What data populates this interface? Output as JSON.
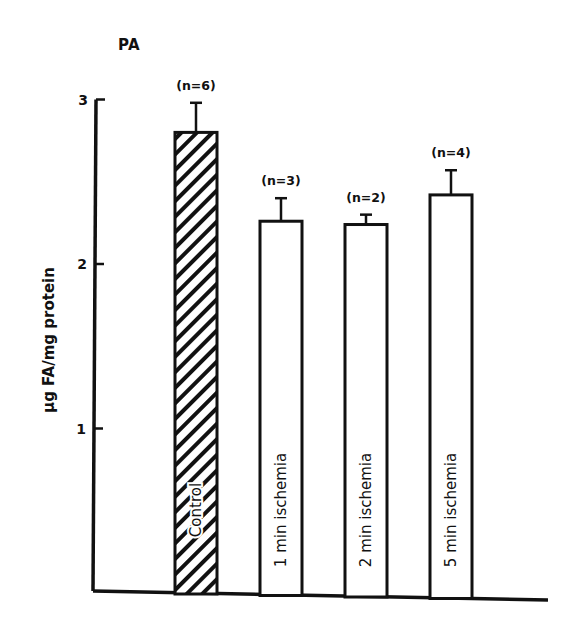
{
  "chart_data": {
    "type": "bar",
    "panel_label": "PA",
    "title": "",
    "xlabel": "",
    "ylabel": "µg FA/mg protein",
    "ylim": [
      0,
      3
    ],
    "yticks": [
      1,
      2,
      3
    ],
    "grid": false,
    "legend": null,
    "categories": [
      "Control",
      "1 min ischemia",
      "2 min ischemia",
      "5 min ischemia"
    ],
    "values": [
      2.8,
      2.26,
      2.24,
      2.42
    ],
    "error_upper": [
      0.18,
      0.14,
      0.06,
      0.15
    ],
    "n_labels": [
      "(n=6)",
      "(n=3)",
      "(n=2)",
      "(n=4)"
    ],
    "fill": [
      "hatched",
      "white",
      "white",
      "white"
    ]
  },
  "colors": {
    "ink": "#111111",
    "background": "#ffffff"
  }
}
